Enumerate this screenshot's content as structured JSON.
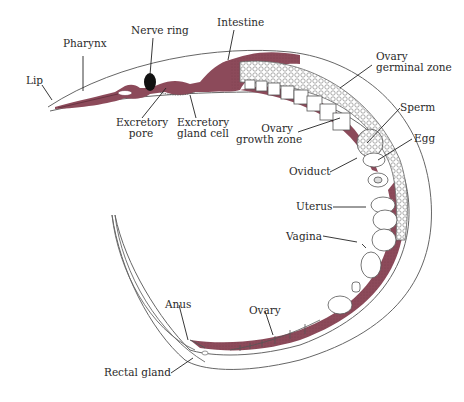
{
  "diagram": {
    "colors": {
      "tissue": "#8c4a5a",
      "tissue_dark": "#6e3444",
      "outline": "#555555",
      "nerve_ring": "#111111",
      "background": "#ffffff",
      "label_text": "#2a2a2a"
    },
    "labels": {
      "lip": "Lip",
      "pharynx": "Pharynx",
      "nerve_ring": "Nerve ring",
      "intestine": "Intestine",
      "ovary_germinal_1": "Ovary",
      "ovary_germinal_2": "germinal zone",
      "excretory_pore_1": "Excretory",
      "excretory_pore_2": "pore",
      "excretory_gland_1": "Excretory",
      "excretory_gland_2": "gland cell",
      "ovary_growth_1": "Ovary",
      "ovary_growth_2": "growth zone",
      "sperm": "Sperm",
      "egg": "Egg",
      "oviduct": "Oviduct",
      "uterus": "Uterus",
      "vagina": "Vagina",
      "anus": "Anus",
      "ovary": "Ovary",
      "rectal_gland": "Rectal gland"
    }
  }
}
